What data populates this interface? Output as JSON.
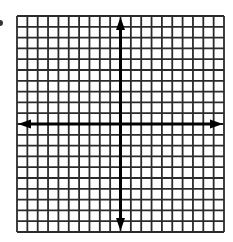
{
  "diagram": {
    "type": "coordinate-plane",
    "grid": {
      "columns": 20,
      "rows": 20,
      "left": 17,
      "top": 16,
      "width": 207,
      "height": 216,
      "line_color": "#2b2b2b",
      "line_width": 1.8,
      "background": "#ffffff"
    },
    "axes": {
      "color": "#000000",
      "width": 3,
      "x_axis_row_index": 10,
      "y_axis_col_index": 10,
      "arrows": [
        "up",
        "down",
        "left",
        "right"
      ]
    },
    "labels": [],
    "stray_mark": {
      "color": "#333333"
    }
  }
}
